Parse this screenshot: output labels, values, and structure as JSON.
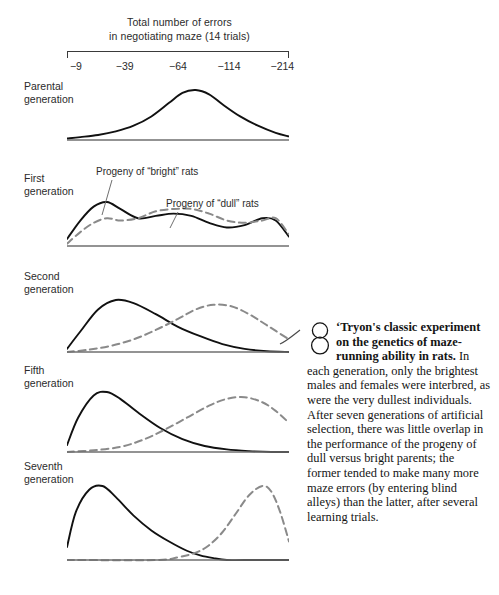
{
  "axis": {
    "title_line1": "Total number of errors",
    "title_line2": "in negotiating maze (14 trials)",
    "tick_labels": [
      "−9",
      "−39",
      "−64",
      "−114",
      "−214"
    ],
    "tick_positions_pct": [
      4,
      26,
      50,
      73,
      97
    ]
  },
  "generations": [
    {
      "label_line1": "Parental",
      "label_line2": "generation"
    },
    {
      "label_line1": "First",
      "label_line2": "generation"
    },
    {
      "label_line1": "Second",
      "label_line2": "generation"
    },
    {
      "label_line1": "Fifth",
      "label_line2": "generation"
    },
    {
      "label_line1": "Seventh",
      "label_line2": "generation"
    }
  ],
  "callouts": {
    "bright": "Progeny of “bright” rats",
    "dull": "Progeny of “dull” rats"
  },
  "caption": {
    "figure_number": "8",
    "lead": "Tryon's classic experiment on the genetics of maze-running ability in rats.",
    "body": " In each generation, only the brightest males and females were interbred, as were the very dullest individuals. After seven generations of artificial selection, there was little overlap in the performance of the progeny of dull versus bright parents; the former tended to make many more maze errors (by entering blind alleys) than the latter, after several learning trials."
  },
  "colors": {
    "solid_curve": "#111111",
    "dashed_curve": "#8a8a8a",
    "baseline": "#6f6f6f",
    "axis": "#3a3a3a",
    "text": "#2b2b2b"
  },
  "chart_data": {
    "type": "line",
    "title": "Total number of errors in negotiating maze (14 trials)",
    "xlabel": "Total number of errors in negotiating maze (14 trials)",
    "ylabel": "",
    "grid": false,
    "legend": [
      "Progeny of “bright” rats",
      "Progeny of “dull” rats"
    ],
    "x_ticks": [
      "−9",
      "−39",
      "−64",
      "−114",
      "−214"
    ],
    "panels": [
      {
        "name": "Parental generation",
        "series": [
          {
            "name": "all rats",
            "style": "solid",
            "x": [
              0,
              6,
              14,
              22,
              30,
              38,
              46,
              52,
              58,
              64,
              70,
              78,
              86,
              94,
              100
            ],
            "values": [
              2,
              4,
              7,
              12,
              20,
              33,
              52,
              66,
              70,
              64,
              50,
              33,
              20,
              10,
              5
            ]
          }
        ]
      },
      {
        "name": "First generation",
        "series": [
          {
            "name": "Progeny of “bright” rats",
            "style": "solid",
            "x": [
              0,
              6,
              12,
              18,
              24,
              32,
              40,
              48,
              56,
              64,
              72,
              80,
              88,
              94,
              100
            ],
            "values": [
              6,
              22,
              34,
              38,
              32,
              24,
              26,
              28,
              26,
              20,
              16,
              18,
              24,
              22,
              8
            ]
          },
          {
            "name": "Progeny of “dull” rats",
            "style": "dashed",
            "x": [
              0,
              6,
              12,
              18,
              24,
              32,
              40,
              48,
              56,
              64,
              72,
              80,
              88,
              94,
              100
            ],
            "values": [
              2,
              12,
              20,
              24,
              22,
              24,
              30,
              32,
              32,
              28,
              22,
              20,
              22,
              24,
              10
            ]
          }
        ]
      },
      {
        "name": "Second generation",
        "series": [
          {
            "name": "Progeny of “bright” rats",
            "style": "solid",
            "x": [
              0,
              6,
              14,
              22,
              30,
              40,
              50,
              60,
              70,
              80,
              90,
              100
            ],
            "values": [
              4,
              26,
              54,
              66,
              62,
              48,
              32,
              20,
              10,
              4,
              1,
              0
            ]
          },
          {
            "name": "Progeny of “dull” rats",
            "style": "dashed",
            "x": [
              0,
              10,
              20,
              30,
              40,
              50,
              58,
              66,
              74,
              82,
              90,
              100
            ],
            "values": [
              0,
              3,
              8,
              16,
              28,
              42,
              54,
              60,
              58,
              48,
              34,
              16
            ]
          }
        ]
      },
      {
        "name": "Fifth generation",
        "series": [
          {
            "name": "Progeny of “bright” rats",
            "style": "solid",
            "x": [
              0,
              5,
              12,
              18,
              24,
              32,
              42,
              52,
              62,
              72,
              82,
              92,
              100
            ],
            "values": [
              8,
              40,
              66,
              70,
              62,
              46,
              28,
              15,
              7,
              3,
              1,
              0,
              0
            ]
          },
          {
            "name": "Progeny of “dull” rats",
            "style": "dashed",
            "x": [
              0,
              12,
              24,
              34,
              44,
              54,
              64,
              72,
              80,
              88,
              94,
              100
            ],
            "values": [
              0,
              2,
              6,
              14,
              26,
              40,
              54,
              62,
              64,
              58,
              48,
              34
            ]
          }
        ]
      },
      {
        "name": "Seventh generation",
        "series": [
          {
            "name": "Progeny of “bright” rats",
            "style": "solid",
            "x": [
              0,
              4,
              10,
              16,
              22,
              30,
              38,
              46,
              54,
              60,
              66,
              72,
              80,
              100
            ],
            "values": [
              14,
              52,
              76,
              80,
              68,
              48,
              32,
              20,
              10,
              5,
              2,
              0,
              0,
              0
            ]
          },
          {
            "name": "Progeny of “dull” rats",
            "style": "dashed",
            "x": [
              0,
              40,
              50,
              58,
              64,
              70,
              76,
              82,
              88,
              92,
              96,
              100
            ],
            "values": [
              0,
              0,
              3,
              8,
              16,
              30,
              50,
              70,
              80,
              74,
              52,
              20
            ]
          }
        ]
      }
    ]
  },
  "panel_layout": [
    {
      "top": 86,
      "height": 56,
      "label_top": 80
    },
    {
      "top": 198,
      "height": 50,
      "label_top": 172
    },
    {
      "top": 296,
      "height": 58,
      "label_top": 270
    },
    {
      "top": 388,
      "height": 66,
      "label_top": 364
    },
    {
      "top": 482,
      "height": 80,
      "label_top": 460
    }
  ]
}
